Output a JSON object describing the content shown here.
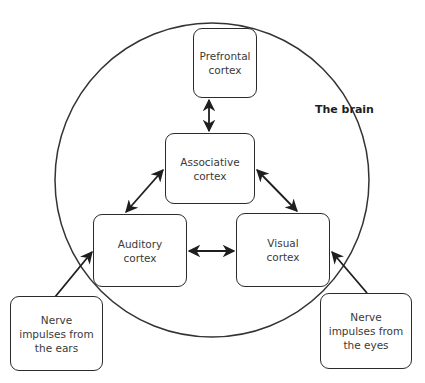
{
  "diagram": {
    "title": "The brain",
    "boundary": {
      "shape": "circle",
      "cx": 212,
      "cy": 180,
      "r": 157,
      "stroke": "#333333"
    },
    "nodes": {
      "prefrontal": {
        "label": "Prefrontal cortex",
        "lines": [
          "Prefrontal",
          "cortex"
        ]
      },
      "associative": {
        "label": "Associative cortex",
        "lines": [
          "Associative",
          "cortex"
        ]
      },
      "auditory": {
        "label": "Auditory cortex",
        "lines": [
          "Auditory",
          "cortex"
        ]
      },
      "visual": {
        "label": "Visual cortex",
        "lines": [
          "Visual",
          "cortex"
        ]
      },
      "ears": {
        "label": "Nerve impulses from the ears",
        "lines": [
          "Nerve",
          "impulses from",
          "the ears"
        ]
      },
      "eyes": {
        "label": "Nerve impulses from the eyes",
        "lines": [
          "Nerve",
          "impulses from",
          "the eyes"
        ]
      }
    },
    "edges": [
      {
        "from": "prefrontal",
        "to": "associative",
        "type": "bidirectional"
      },
      {
        "from": "associative",
        "to": "auditory",
        "type": "bidirectional"
      },
      {
        "from": "associative",
        "to": "visual",
        "type": "bidirectional"
      },
      {
        "from": "auditory",
        "to": "visual",
        "type": "bidirectional"
      },
      {
        "from": "ears",
        "to": "auditory",
        "type": "directed"
      },
      {
        "from": "eyes",
        "to": "visual",
        "type": "directed"
      }
    ],
    "colors": {
      "stroke": "#2b2b2b",
      "text": "#3a3a3a",
      "background": "#ffffff"
    }
  }
}
